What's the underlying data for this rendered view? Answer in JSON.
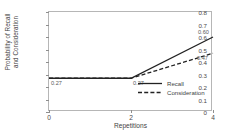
{
  "chart_data": {
    "type": "line",
    "title": "",
    "xlabel": "Repetitions",
    "ylabel_line1": "Probability of Recall",
    "ylabel_line2": "and Consideration",
    "xlim": [
      0,
      4
    ],
    "ylim": [
      0,
      0.8
    ],
    "xticks": [
      "0",
      "2",
      "4"
    ],
    "xtick_values": [
      0,
      2,
      4
    ],
    "yticks": [
      "0",
      "0.1",
      "0.2",
      "0.3",
      "0.4",
      "0.5",
      "0.6",
      "0.7",
      "0.8"
    ],
    "ytick_values": [
      0,
      0.1,
      0.2,
      0.3,
      0.4,
      0.5,
      0.6,
      0.7,
      0.8
    ],
    "grid": false,
    "legend_position": "center-right-inside",
    "x": [
      0,
      2,
      4
    ],
    "series": [
      {
        "name": "Recall",
        "style": "solid",
        "color": "#222222",
        "values": [
          0.27,
          0.27,
          0.6
        ]
      },
      {
        "name": "Consideration",
        "style": "dashed",
        "color": "#222222",
        "values": [
          0.27,
          0.27,
          0.47
        ]
      }
    ],
    "annotations": [
      {
        "text": "0.27",
        "x": 0,
        "y": 0.27,
        "placement": "below-right"
      },
      {
        "text": "0.27",
        "x": 2,
        "y": 0.27,
        "placement": "below-right"
      },
      {
        "text": "0.60",
        "x": 4,
        "y": 0.6,
        "placement": "above-left"
      },
      {
        "text": "0.47",
        "x": 4,
        "y": 0.47,
        "placement": "below-left"
      }
    ]
  },
  "legend": {
    "items": [
      {
        "label": "Recall"
      },
      {
        "label": "Consideration"
      }
    ]
  },
  "colors": {
    "frame": "#b6b6b6",
    "text": "#3f3f3f",
    "line": "#222222"
  }
}
